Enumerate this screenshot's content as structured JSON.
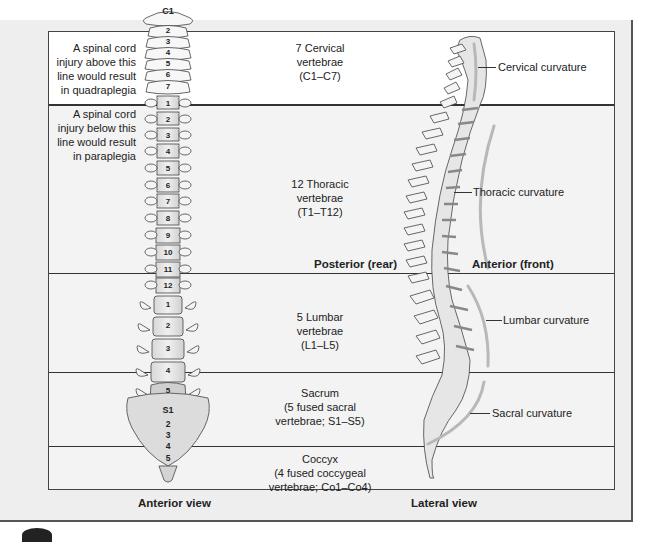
{
  "figure": {
    "left_notes": {
      "quadraplegia": "A spinal cord\ninjury above this\nline would result\nin quadraplegia",
      "paraplegia": "A spinal cord\ninjury below this\nline would result\nin paraplegia"
    },
    "regions": [
      {
        "id": "cervical",
        "label": "7 Cervical\nvertebrae\n(C1–C7)"
      },
      {
        "id": "thoracic",
        "label": "12 Thoracic\nvertebrae\n(T1–T12)"
      },
      {
        "id": "lumbar",
        "label": "5 Lumbar\nvertebrae\n(L1–L5)"
      },
      {
        "id": "sacrum",
        "label": "Sacrum\n(5 fused sacral\nvertebrae; S1–S5)"
      },
      {
        "id": "coccyx",
        "label": "Coccyx\n(4 fused coccygeal\nvertebrae; Co1–Co4)"
      }
    ],
    "anterior_vertebra_labels": {
      "cervical": [
        "C1",
        "2",
        "3",
        "4",
        "5",
        "6",
        "7"
      ],
      "thoracic": [
        "1",
        "2",
        "3",
        "4",
        "5",
        "6",
        "7",
        "8",
        "9",
        "10",
        "11",
        "12"
      ],
      "lumbar": [
        "1",
        "2",
        "3",
        "4",
        "5"
      ],
      "sacral": [
        "S1",
        "2",
        "3",
        "4",
        "5"
      ]
    },
    "curvatures": {
      "cervical": "Cervical curvature",
      "thoracic": "Thoracic curvature",
      "lumbar": "Lumbar curvature",
      "sacral": "Sacral curvature"
    },
    "orientation": {
      "posterior": "Posterior (rear)",
      "anterior": "Anterior (front)"
    },
    "views": {
      "anterior": "Anterior view",
      "lateral": "Lateral view"
    },
    "colors": {
      "bone": "#f4f4f4",
      "bone_shade": "#cfcfcf",
      "disc": "#9a9a9a",
      "curvature_arc": "#b8b8b8",
      "line": "#333333"
    }
  }
}
